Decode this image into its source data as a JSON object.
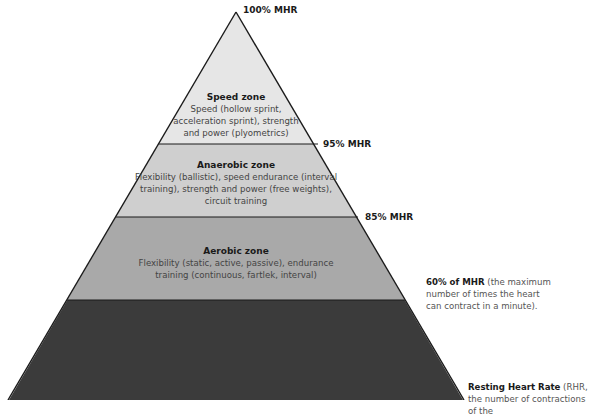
{
  "diagram": {
    "type": "pyramid",
    "colors": {
      "speed": "#e6e6e6",
      "anaerobic": "#cfcfcf",
      "aerobic": "#a9a9a9",
      "resting": "#3b3b3b",
      "outline": "#1a1a1a"
    },
    "thresholds": {
      "top": "100% MHR",
      "speed_anaerobic": "95% MHR",
      "anaerobic_aerobic": "85% MHR"
    },
    "zones": [
      {
        "title": "Speed zone",
        "description": "Speed (hollow sprint, acceleration sprint), strength and power (plyometrics)"
      },
      {
        "title": "Anaerobic zone",
        "description": "Flexibility (ballistic), speed endurance (interval training), strength and power (free weights), circuit training"
      },
      {
        "title": "Aerobic zone",
        "description": "Flexibility (static, active, passive), endurance training (continuous, fartlek, interval)"
      }
    ],
    "notes": [
      {
        "bold": "60% of MHR",
        "text": " (the maximum number of times the heart can contract in a minute)."
      },
      {
        "bold": "Resting Heart Rate",
        "text": " (RHR, the number of contractions of the"
      }
    ]
  }
}
